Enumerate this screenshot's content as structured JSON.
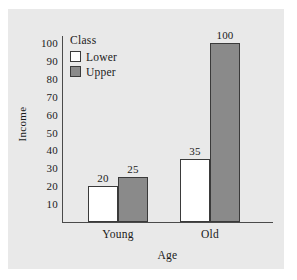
{
  "chart_data": {
    "type": "bar",
    "title": "",
    "xlabel": "Age",
    "ylabel": "Income",
    "categories": [
      "Young",
      "Old"
    ],
    "series": [
      {
        "name": "Lower",
        "values": [
          20,
          35
        ],
        "color": "#ffffff"
      },
      {
        "name": "Upper",
        "values": [
          25,
          100
        ],
        "color": "#8a8a8a"
      }
    ],
    "legend": {
      "title": "Class",
      "position": "inside-top-left",
      "entries": [
        "Lower",
        "Upper"
      ]
    },
    "ylim": [
      0,
      104
    ],
    "yticks": [
      10,
      20,
      30,
      40,
      50,
      60,
      70,
      80,
      90,
      100
    ],
    "ytick_labels": [
      "10",
      "20",
      "30",
      "40",
      "50",
      "60",
      "70",
      "80",
      "90",
      "100"
    ],
    "xtick_labels": [
      "Young",
      "Old"
    ],
    "data_labels": [
      "20",
      "25",
      "35",
      "100"
    ],
    "grid": false,
    "panel_color": "#e9e9e9",
    "axis_color": "#4a4a4a",
    "bar_border_color": "#3a3a3a"
  }
}
